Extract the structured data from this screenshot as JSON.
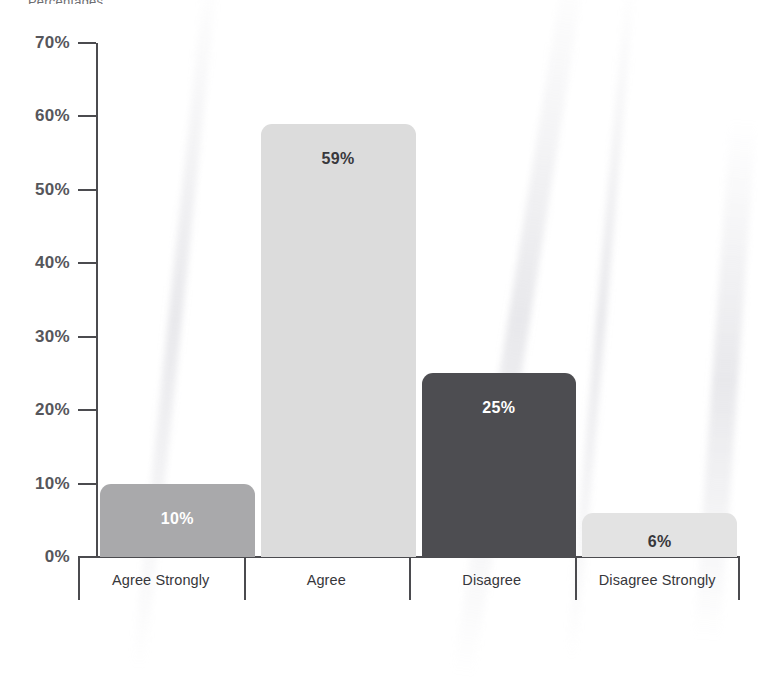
{
  "top_caption": "Percentages",
  "chart_data": {
    "type": "bar",
    "title": "",
    "subtitle": "",
    "xlabel": "",
    "ylabel": "",
    "categories": [
      "Agree Strongly",
      "Agree",
      "Disagree",
      "Disagree Strongly"
    ],
    "values": [
      10,
      59,
      25,
      6
    ],
    "value_labels": [
      "10%",
      "59%",
      "25%",
      "6%"
    ],
    "ylim": [
      0,
      70
    ],
    "yticks": [
      0,
      10,
      20,
      30,
      40,
      50,
      60,
      70
    ],
    "ytick_labels": [
      "0%",
      "10%",
      "20%",
      "30%",
      "40%",
      "50%",
      "60%",
      "70%"
    ],
    "grid": false,
    "legend": false,
    "bar_colors": [
      "#a9a9ab",
      "#dcdcdc",
      "#4d4d51",
      "#e3e3e3"
    ],
    "bar_label_colors": [
      "#ffffff",
      "#38383c",
      "#ffffff",
      "#38383c"
    ],
    "axis_color": "#4b4b4f",
    "tick_label_color": "#56565b"
  }
}
